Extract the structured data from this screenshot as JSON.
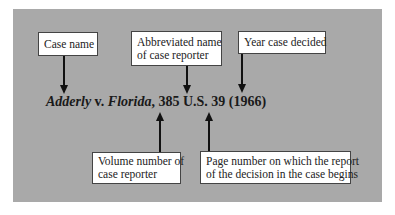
{
  "diagram": {
    "citation": {
      "party1": "Adderly",
      "versus": " v. ",
      "party2": "Florida",
      "separator": ", ",
      "volume": "385",
      "reporter": " U.S. ",
      "page": "39",
      "year": " (1966)"
    },
    "labels": {
      "case_name": "Case name",
      "reporter_line1": "Abbreviated name",
      "reporter_line2": "of case reporter",
      "year": "Year case decided",
      "volume_line1": "Volume number of",
      "volume_line2": "case reporter",
      "page_line1": "Page number on which the report",
      "page_line2": "of the decision in the case begins"
    },
    "colors": {
      "panel": "#a9a9a9",
      "box": "#ffffff",
      "arrow": "#111111"
    }
  }
}
